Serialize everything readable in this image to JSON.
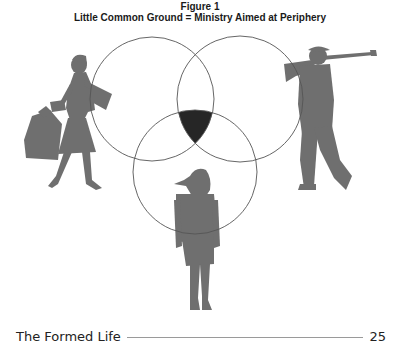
{
  "figure": {
    "number": "Figure 1",
    "title": "Little Common Ground = Ministry Aimed at Periphery"
  },
  "diagram": {
    "type": "venn",
    "sets": [
      {
        "name": "left-circle",
        "figure": "woman-shopping-silhouette"
      },
      {
        "name": "right-circle",
        "figure": "man-golfing-silhouette"
      },
      {
        "name": "bottom-circle",
        "figure": "girl-standing-silhouette"
      }
    ],
    "common_region": "center-intersection",
    "colors": {
      "outline": "#555555",
      "intersection_fill": "#262626",
      "silhouette": "#6f6f6f"
    }
  },
  "footer": {
    "title": "The Formed Life",
    "page_number": "25"
  }
}
